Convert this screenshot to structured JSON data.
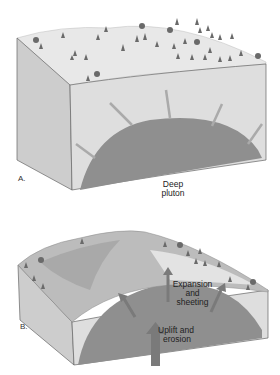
{
  "panels": [
    {
      "id": "A",
      "label": "A.",
      "annotations": [
        {
          "text_line1": "Deep",
          "text_line2": "pluton"
        }
      ]
    },
    {
      "id": "B",
      "label": "B.",
      "annotations": [
        {
          "text_line1": "Expansion",
          "text_line2": "and",
          "text_line3": "sheeting"
        },
        {
          "text_line1": "Uplift and",
          "text_line2": "erosion"
        }
      ]
    }
  ],
  "colors": {
    "surface": "#e6e6e6",
    "side_left": "#cfcfcf",
    "side_front": "#dcdcdc",
    "pluton": "#8e8e8e",
    "arrow": "#a5a5a5",
    "tree": "#6a6a6a"
  }
}
